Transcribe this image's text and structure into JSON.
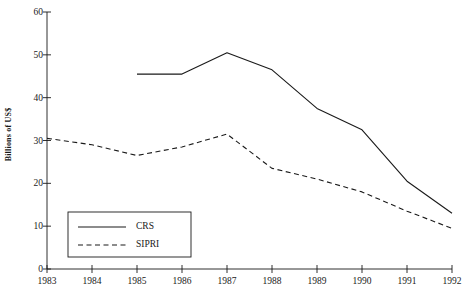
{
  "chart_data": {
    "type": "line",
    "title": "",
    "xlabel": "",
    "ylabel": "Billions of US$",
    "x": [
      1983,
      1984,
      1985,
      1986,
      1987,
      1988,
      1989,
      1990,
      1991,
      1992
    ],
    "xtick_labels": [
      "1983",
      "1984",
      "1985",
      "1986",
      "1987",
      "1988",
      "1989",
      "1990",
      "1991",
      "1992"
    ],
    "ytick_labels": [
      "0",
      "10",
      "20",
      "30",
      "40",
      "50",
      "60"
    ],
    "yticks": [
      0,
      10,
      20,
      30,
      40,
      50,
      60
    ],
    "ylim": [
      0,
      60
    ],
    "xlim": [
      1983,
      1992
    ],
    "grid": false,
    "legend_position": "lower left",
    "series": [
      {
        "name": "CRS",
        "style": "solid",
        "color": "#1a1a1a",
        "x": [
          1985,
          1986,
          1987,
          1988,
          1989,
          1990,
          1991,
          1992
        ],
        "values": [
          45.5,
          45.5,
          50.5,
          46.5,
          37.5,
          32.5,
          20.5,
          13.0
        ]
      },
      {
        "name": "SIPRI",
        "style": "dashed",
        "color": "#1a1a1a",
        "x": [
          1983,
          1984,
          1985,
          1986,
          1987,
          1988,
          1989,
          1990,
          1991,
          1992
        ],
        "values": [
          30.5,
          29.0,
          26.5,
          28.5,
          31.5,
          23.5,
          21.0,
          18.0,
          13.5,
          9.5
        ]
      }
    ]
  },
  "axes": {
    "y_title": "Billions of US$"
  },
  "legend": {
    "entries": [
      {
        "label": "CRS",
        "style": "solid"
      },
      {
        "label": "SIPRI",
        "style": "dashed"
      }
    ]
  }
}
